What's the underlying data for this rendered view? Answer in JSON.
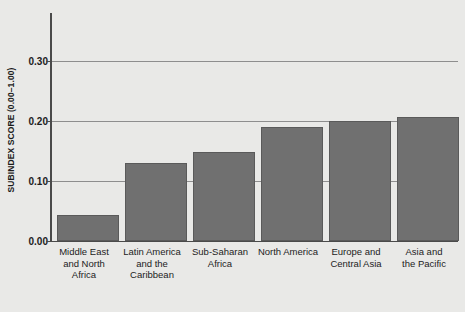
{
  "chart_data": {
    "type": "bar",
    "title": "",
    "xlabel": "",
    "ylabel": "SUBINDEX SCORE (0.00–1.00)",
    "categories": [
      "Middle East and North Africa",
      "Latin America and the Caribbean",
      "Sub-Saharan Africa",
      "North America",
      "Europe and Central Asia",
      "Asia and the Pacific"
    ],
    "category_lines": [
      [
        "Middle East",
        "and North",
        "Africa"
      ],
      [
        "Latin America",
        "and the",
        "Caribbean"
      ],
      [
        "Sub-Saharan",
        "Africa"
      ],
      [
        "North America"
      ],
      [
        "Europe and",
        "Central Asia"
      ],
      [
        "Asia and",
        "the Pacific"
      ]
    ],
    "values": [
      0.043,
      0.13,
      0.148,
      0.19,
      0.2,
      0.206
    ],
    "ylim": [
      0.0,
      0.38
    ],
    "yticks": [
      0.0,
      0.1,
      0.2,
      0.3
    ],
    "ytick_labels": [
      "0.00",
      "0.10",
      "0.20",
      "0.30"
    ],
    "grid": true,
    "legend": null,
    "bar_color": "#707070",
    "grid_color": "#8e8e8e",
    "axis_color": "#4a4a4a",
    "background_color": "#e9e9e7"
  }
}
